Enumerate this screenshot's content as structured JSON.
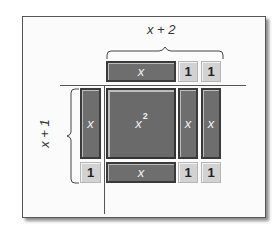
{
  "diagram": {
    "top_dimension_label": "x + 2",
    "left_dimension_label": "x + 1",
    "top_row": [
      {
        "kind": "x",
        "label": "x"
      },
      {
        "kind": "unit",
        "label": "1"
      },
      {
        "kind": "unit",
        "label": "1"
      }
    ],
    "left_column": [
      {
        "kind": "x",
        "label": "x"
      },
      {
        "kind": "unit",
        "label": "1"
      }
    ],
    "product": {
      "x_squared": {
        "label": "x",
        "exponent": "2"
      },
      "right_x_tiles": [
        "x",
        "x"
      ],
      "bottom_x_tile": "x",
      "bottom_unit_tiles": [
        "1",
        "1"
      ]
    },
    "colors": {
      "x_tile": "#6e6e6e",
      "unit_tile": "#d2d2d2",
      "tile_border": "#3a3a3a",
      "frame_border": "#555555"
    }
  }
}
